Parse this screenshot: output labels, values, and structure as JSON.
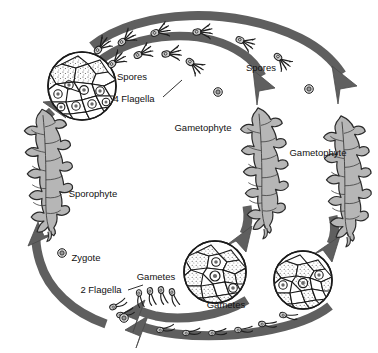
{
  "diagram": {
    "type": "life-cycle-diagram",
    "background_color": "#ffffff",
    "colors": {
      "arrow_gray": "#5f5f5f",
      "arrow_outline": "#3a3a3a",
      "frond_fill": "#b6b6b6",
      "frond_outline": "#2b2b2b",
      "cell_fill": "#ffffff",
      "cell_outline": "#1a1a1a",
      "label_text": "#111111"
    },
    "labels": [
      {
        "id": "spores-left",
        "text": "Spores",
        "x": 132,
        "y": 77
      },
      {
        "id": "four-flagella",
        "text": "4 Flagella",
        "x": 134,
        "y": 99
      },
      {
        "id": "spores-right",
        "text": "Spores",
        "x": 261,
        "y": 68
      },
      {
        "id": "gametophyte-1",
        "text": "Gametophyte",
        "x": 203,
        "y": 128
      },
      {
        "id": "gametophyte-2",
        "text": "Gametophyte",
        "x": 318,
        "y": 153
      },
      {
        "id": "sporophyte",
        "text": "Sporophyte",
        "x": 93,
        "y": 194
      },
      {
        "id": "zygote",
        "text": "Zygote",
        "x": 86,
        "y": 258
      },
      {
        "id": "two-flagella",
        "text": "2 Flagella",
        "x": 101,
        "y": 290
      },
      {
        "id": "gametes-upper",
        "text": "Gametes",
        "x": 156,
        "y": 277
      },
      {
        "id": "gametes-lower",
        "text": "Gametes",
        "x": 226,
        "y": 305
      }
    ],
    "stages": [
      {
        "id": "sporangium-cells",
        "kind": "cell-cluster-circle",
        "label": "Sporophyte spore-producing cells",
        "cx": 82,
        "cy": 86,
        "r": 34
      },
      {
        "id": "sporophyte-frond",
        "kind": "fern-frond",
        "label": "Sporophyte",
        "cx": 42,
        "cy": 172
      },
      {
        "id": "gametophyte-frond-1",
        "kind": "fern-frond",
        "label": "Gametophyte",
        "cx": 258,
        "cy": 170
      },
      {
        "id": "gametophyte-frond-2",
        "kind": "fern-frond",
        "label": "Gametophyte",
        "cx": 341,
        "cy": 178
      },
      {
        "id": "gametangia-cells-1",
        "kind": "cell-cluster-circle",
        "label": "Gametophyte gamete-producing cells",
        "cx": 215,
        "cy": 272,
        "r": 31
      },
      {
        "id": "gametangia-cells-2",
        "kind": "cell-cluster-circle",
        "label": "Gametophyte gamete-producing cells",
        "cx": 303,
        "cy": 280,
        "r": 29
      }
    ],
    "gametes": {
      "spore_flagella_count": 4,
      "gamete_flagella_count": 2
    },
    "arrows": [
      {
        "id": "arrow-spores-outer",
        "from": "sporangium-cells",
        "to": "gametophyte-frond-2",
        "direction": "clockwise-top"
      },
      {
        "id": "arrow-spores-inner",
        "from": "sporangium-cells",
        "to": "gametophyte-frond-1",
        "direction": "clockwise-top"
      },
      {
        "id": "arrow-gameto1-to-cells",
        "from": "gametophyte-frond-1",
        "to": "gametangia-cells-1",
        "direction": "down"
      },
      {
        "id": "arrow-gameto2-to-cells",
        "from": "gametophyte-frond-2",
        "to": "gametangia-cells-2",
        "direction": "down"
      },
      {
        "id": "arrow-gametes-upper",
        "from": "gametangia-cells-1",
        "to": "zygote",
        "direction": "counterclockwise-bottom"
      },
      {
        "id": "arrow-gametes-lower",
        "from": "gametangia-cells-2",
        "to": "zygote",
        "direction": "counterclockwise-bottom"
      },
      {
        "id": "arrow-zygote-to-sporophyte",
        "from": "zygote",
        "to": "sporophyte-frond",
        "direction": "up"
      },
      {
        "id": "arrow-sporophyte-to-cells",
        "from": "sporophyte-frond",
        "to": "sporangium-cells",
        "direction": "up-right"
      }
    ]
  }
}
